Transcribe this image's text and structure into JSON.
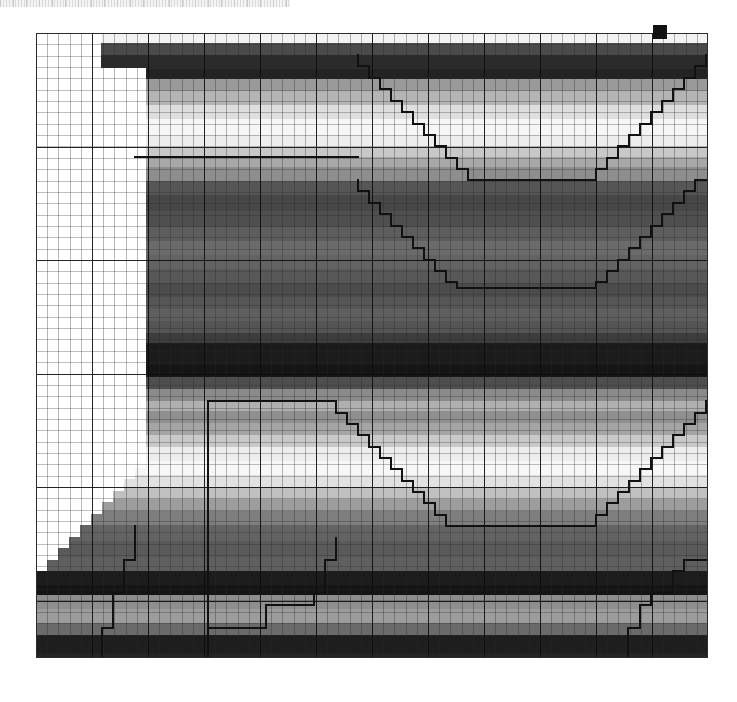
{
  "page": {
    "background_color": "#ffffff",
    "width": 737,
    "height": 702
  },
  "top_strip": {
    "name": "striped-ruler-strip",
    "x": 0,
    "y": 0,
    "width": 290,
    "height": 7,
    "tick_color": "#d0d0d0",
    "background_color": "#ffffff"
  },
  "plot": {
    "x": 36,
    "y": 33,
    "width": 672,
    "height": 625,
    "border_color": "#2b2b2b",
    "fine_grid_color": "#3a3a3a",
    "major_grid_color": "#0a0a0a",
    "fine_cell_w": 11.2,
    "fine_cell_h": 11.35,
    "major_cell_w": 56,
    "major_cell_h": 113.5
  },
  "corner_marker": {
    "name": "top-right-dark-square",
    "x": 653,
    "y": 25,
    "width": 14,
    "height": 14,
    "color": "#111111"
  },
  "chart_data": {
    "type": "heatmap",
    "title": "",
    "xlabel": "",
    "ylabel": "",
    "grid": true,
    "legend": "none",
    "colormap": "grayscale",
    "xlim": [
      0,
      60
    ],
    "ylim": [
      0,
      55
    ],
    "note": "Horizontal grayscale bands (row-wise intensity profile) with a white masked wedge on the left and two black stair-stepped contour polylines overlaid.",
    "band_profile": [
      {
        "y": 0,
        "h": 10,
        "gray": "#f2f2f2"
      },
      {
        "y": 10,
        "h": 12,
        "gray": "#4a4a4a"
      },
      {
        "y": 22,
        "h": 14,
        "gray": "#2b2b2b"
      },
      {
        "y": 36,
        "h": 10,
        "gray": "#232323"
      },
      {
        "y": 46,
        "h": 12,
        "gray": "#9a9a9a"
      },
      {
        "y": 58,
        "h": 14,
        "gray": "#b4b4b4"
      },
      {
        "y": 72,
        "h": 14,
        "gray": "#dedede"
      },
      {
        "y": 86,
        "h": 16,
        "gray": "#f6f6f6"
      },
      {
        "y": 102,
        "h": 12,
        "gray": "#ededed"
      },
      {
        "y": 114,
        "h": 10,
        "gray": "#c8c8c8"
      },
      {
        "y": 124,
        "h": 10,
        "gray": "#a8a8a8"
      },
      {
        "y": 134,
        "h": 14,
        "gray": "#8e8e8e"
      },
      {
        "y": 148,
        "h": 14,
        "gray": "#565656"
      },
      {
        "y": 162,
        "h": 16,
        "gray": "#474747"
      },
      {
        "y": 178,
        "h": 16,
        "gray": "#4f4f4f"
      },
      {
        "y": 194,
        "h": 14,
        "gray": "#5d5d5d"
      },
      {
        "y": 208,
        "h": 14,
        "gray": "#6b6b6b"
      },
      {
        "y": 222,
        "h": 14,
        "gray": "#636363"
      },
      {
        "y": 236,
        "h": 14,
        "gray": "#585858"
      },
      {
        "y": 250,
        "h": 14,
        "gray": "#4c4c4c"
      },
      {
        "y": 264,
        "h": 12,
        "gray": "#565656"
      },
      {
        "y": 276,
        "h": 12,
        "gray": "#5f5f5f"
      },
      {
        "y": 288,
        "h": 12,
        "gray": "#545454"
      },
      {
        "y": 300,
        "h": 10,
        "gray": "#3d3d3d"
      },
      {
        "y": 310,
        "h": 22,
        "gray": "#1b1b1b"
      },
      {
        "y": 332,
        "h": 12,
        "gray": "#151515"
      },
      {
        "y": 344,
        "h": 12,
        "gray": "#4e4e4e"
      },
      {
        "y": 356,
        "h": 12,
        "gray": "#8a8a8a"
      },
      {
        "y": 368,
        "h": 10,
        "gray": "#b0b0b0"
      },
      {
        "y": 378,
        "h": 12,
        "gray": "#8f8f8f"
      },
      {
        "y": 390,
        "h": 12,
        "gray": "#a5a5a5"
      },
      {
        "y": 402,
        "h": 12,
        "gray": "#c9c9c9"
      },
      {
        "y": 414,
        "h": 14,
        "gray": "#ededed"
      },
      {
        "y": 428,
        "h": 14,
        "gray": "#f7f7f7"
      },
      {
        "y": 442,
        "h": 12,
        "gray": "#e2e2e2"
      },
      {
        "y": 454,
        "h": 12,
        "gray": "#c0c0c0"
      },
      {
        "y": 466,
        "h": 12,
        "gray": "#9d9d9d"
      },
      {
        "y": 478,
        "h": 14,
        "gray": "#7e7e7e"
      },
      {
        "y": 492,
        "h": 16,
        "gray": "#636363"
      },
      {
        "y": 508,
        "h": 16,
        "gray": "#5a5a5a"
      },
      {
        "y": 524,
        "h": 14,
        "gray": "#5f5f5f"
      },
      {
        "y": 538,
        "h": 14,
        "gray": "#1c1c1c"
      },
      {
        "y": 552,
        "h": 10,
        "gray": "#151515"
      },
      {
        "y": 562,
        "h": 14,
        "gray": "#8e8e8e"
      },
      {
        "y": 576,
        "h": 14,
        "gray": "#9c9c9c"
      },
      {
        "y": 590,
        "h": 12,
        "gray": "#6a6a6a"
      },
      {
        "y": 602,
        "h": 18,
        "gray": "#1e1e1e"
      },
      {
        "y": 620,
        "h": 12,
        "gray": "#242424"
      },
      {
        "y": 632,
        "h": 16,
        "gray": "#4d4d4d"
      },
      {
        "y": 648,
        "h": 12,
        "gray": "#4a4a4a"
      }
    ],
    "white_mask_steps": [
      {
        "x": 0,
        "y": 0,
        "w": 65,
        "h": 35
      },
      {
        "x": 0,
        "y": 35,
        "w": 110,
        "h": 87
      },
      {
        "x": 0,
        "y": 122,
        "w": 110,
        "h": 291
      },
      {
        "x": 0,
        "y": 413,
        "w": 110,
        "h": 22
      },
      {
        "x": 0,
        "y": 435,
        "w": 99,
        "h": 11
      },
      {
        "x": 0,
        "y": 446,
        "w": 88,
        "h": 12
      },
      {
        "x": 0,
        "y": 458,
        "w": 77,
        "h": 11
      },
      {
        "x": 0,
        "y": 469,
        "w": 66,
        "h": 12
      },
      {
        "x": 0,
        "y": 481,
        "w": 55,
        "h": 11
      },
      {
        "x": 0,
        "y": 492,
        "w": 44,
        "h": 12
      },
      {
        "x": 0,
        "y": 504,
        "w": 33,
        "h": 11
      },
      {
        "x": 0,
        "y": 515,
        "w": 22,
        "h": 12
      },
      {
        "x": 0,
        "y": 527,
        "w": 11,
        "h": 11
      }
    ],
    "contours": [
      {
        "name": "upper-contour",
        "color": "#111111",
        "width": 2.2,
        "points": [
          [
            322,
            22
          ],
          [
            322,
            33
          ],
          [
            333,
            33
          ],
          [
            333,
            45
          ],
          [
            344,
            45
          ],
          [
            344,
            56
          ],
          [
            355,
            56
          ],
          [
            355,
            68
          ],
          [
            366,
            68
          ],
          [
            366,
            79
          ],
          [
            377,
            79
          ],
          [
            377,
            91
          ],
          [
            388,
            91
          ],
          [
            388,
            102
          ],
          [
            399,
            102
          ],
          [
            399,
            113
          ],
          [
            410,
            113
          ],
          [
            410,
            125
          ],
          [
            421,
            125
          ],
          [
            421,
            136
          ],
          [
            432,
            136
          ],
          [
            432,
            147
          ],
          [
            455,
            147
          ],
          [
            455,
            147
          ],
          [
            560,
            147
          ],
          [
            560,
            136
          ],
          [
            571,
            136
          ],
          [
            571,
            125
          ],
          [
            582,
            125
          ],
          [
            582,
            113
          ],
          [
            593,
            113
          ],
          [
            593,
            102
          ],
          [
            604,
            102
          ],
          [
            604,
            91
          ],
          [
            615,
            91
          ],
          [
            615,
            79
          ],
          [
            626,
            79
          ],
          [
            626,
            68
          ],
          [
            637,
            68
          ],
          [
            637,
            56
          ],
          [
            648,
            56
          ],
          [
            648,
            45
          ],
          [
            659,
            45
          ],
          [
            659,
            33
          ],
          [
            670,
            33
          ],
          [
            670,
            22
          ]
        ]
      },
      {
        "name": "upper-contour-lower-branch",
        "color": "#111111",
        "width": 2.2,
        "points": [
          [
            99,
            124
          ],
          [
            322,
            124
          ]
        ]
      },
      {
        "name": "mid-contour",
        "color": "#111111",
        "width": 2.2,
        "points": [
          [
            322,
            147
          ],
          [
            322,
            158
          ],
          [
            333,
            158
          ],
          [
            333,
            170
          ],
          [
            344,
            170
          ],
          [
            344,
            181
          ],
          [
            355,
            181
          ],
          [
            355,
            193
          ],
          [
            366,
            193
          ],
          [
            366,
            204
          ],
          [
            377,
            204
          ],
          [
            377,
            215
          ],
          [
            388,
            215
          ],
          [
            388,
            227
          ],
          [
            399,
            227
          ],
          [
            399,
            238
          ],
          [
            410,
            238
          ],
          [
            410,
            249
          ],
          [
            421,
            249
          ],
          [
            421,
            255
          ],
          [
            560,
            255
          ],
          [
            560,
            249
          ],
          [
            571,
            249
          ],
          [
            571,
            238
          ],
          [
            582,
            238
          ],
          [
            582,
            227
          ],
          [
            593,
            227
          ],
          [
            593,
            215
          ],
          [
            604,
            215
          ],
          [
            604,
            204
          ],
          [
            615,
            204
          ],
          [
            615,
            193
          ],
          [
            626,
            193
          ],
          [
            626,
            181
          ],
          [
            637,
            181
          ],
          [
            637,
            170
          ],
          [
            648,
            170
          ],
          [
            648,
            158
          ],
          [
            659,
            158
          ],
          [
            659,
            147
          ],
          [
            670,
            147
          ]
        ]
      },
      {
        "name": "lower-contour",
        "color": "#111111",
        "width": 2.2,
        "points": [
          [
            172,
            368
          ],
          [
            300,
            368
          ],
          [
            300,
            380
          ],
          [
            311,
            380
          ],
          [
            311,
            391
          ],
          [
            322,
            391
          ],
          [
            322,
            402
          ],
          [
            333,
            402
          ],
          [
            333,
            414
          ],
          [
            344,
            414
          ],
          [
            344,
            425
          ],
          [
            355,
            425
          ],
          [
            355,
            436
          ],
          [
            366,
            436
          ],
          [
            366,
            448
          ],
          [
            377,
            448
          ],
          [
            377,
            459
          ],
          [
            388,
            459
          ],
          [
            388,
            470
          ],
          [
            399,
            470
          ],
          [
            399,
            482
          ],
          [
            410,
            482
          ],
          [
            410,
            493
          ],
          [
            560,
            493
          ],
          [
            560,
            482
          ],
          [
            571,
            482
          ],
          [
            571,
            470
          ],
          [
            582,
            470
          ],
          [
            582,
            459
          ],
          [
            593,
            459
          ],
          [
            593,
            448
          ],
          [
            604,
            448
          ],
          [
            604,
            436
          ],
          [
            615,
            436
          ],
          [
            615,
            425
          ],
          [
            626,
            425
          ],
          [
            626,
            414
          ],
          [
            637,
            414
          ],
          [
            637,
            402
          ],
          [
            648,
            402
          ],
          [
            648,
            391
          ],
          [
            659,
            391
          ],
          [
            659,
            380
          ],
          [
            670,
            380
          ],
          [
            670,
            368
          ]
        ]
      },
      {
        "name": "lower-left-riser",
        "color": "#111111",
        "width": 2.2,
        "points": [
          [
            172,
            368
          ],
          [
            172,
            625
          ]
        ]
      },
      {
        "name": "bottom-left-step",
        "color": "#111111",
        "width": 2.2,
        "points": [
          [
            99,
            493
          ],
          [
            99,
            527
          ],
          [
            88,
            527
          ],
          [
            88,
            560
          ],
          [
            77,
            560
          ],
          [
            77,
            595
          ],
          [
            66,
            595
          ],
          [
            66,
            625
          ]
        ]
      },
      {
        "name": "bottom-center-step",
        "color": "#111111",
        "width": 2.2,
        "points": [
          [
            300,
            505
          ],
          [
            300,
            527
          ],
          [
            289,
            527
          ],
          [
            289,
            560
          ],
          [
            278,
            560
          ],
          [
            278,
            572
          ],
          [
            230,
            572
          ],
          [
            230,
            595
          ],
          [
            172,
            595
          ]
        ]
      },
      {
        "name": "right-lower-step",
        "color": "#111111",
        "width": 2.2,
        "points": [
          [
            670,
            527
          ],
          [
            648,
            527
          ],
          [
            648,
            538
          ],
          [
            637,
            538
          ],
          [
            637,
            560
          ],
          [
            615,
            560
          ],
          [
            615,
            572
          ],
          [
            604,
            572
          ],
          [
            604,
            595
          ],
          [
            592,
            595
          ],
          [
            592,
            625
          ]
        ]
      }
    ]
  }
}
